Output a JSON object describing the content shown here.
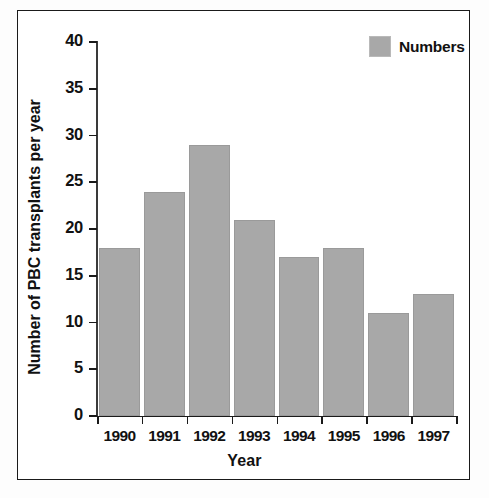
{
  "chart_data": {
    "type": "bar",
    "title": "",
    "categories": [
      "1990",
      "1991",
      "1992",
      "1993",
      "1994",
      "1995",
      "1996",
      "1997"
    ],
    "values": [
      18,
      24,
      29,
      21,
      17,
      18,
      11,
      13
    ],
    "series": [
      {
        "name": "Numbers",
        "values": [
          18,
          24,
          29,
          21,
          17,
          18,
          11,
          13
        ]
      }
    ],
    "xlabel": "Year",
    "ylabel": "Number of PBC transplants per year",
    "ylim": [
      0,
      40
    ],
    "yticks": [
      0,
      5,
      10,
      15,
      20,
      25,
      30,
      35,
      40
    ],
    "ytick_labels": [
      "0",
      "5",
      "10",
      "15",
      "20",
      "25",
      "30",
      "35",
      "40"
    ],
    "grid": false,
    "legend": {
      "position": "top-right",
      "entries": [
        {
          "label": "Numbers",
          "color": "#a8a8a8"
        }
      ]
    },
    "colors": {
      "bar_fill": "#a8a8a8",
      "bar_edge": "#9a9a9a",
      "axis": "#1a1a1a",
      "text": "#111111",
      "background": "#ffffff",
      "frame": "#1a1a1a"
    }
  }
}
